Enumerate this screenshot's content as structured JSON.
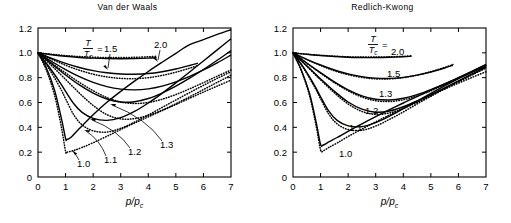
{
  "figure": {
    "xlabel": "p/p_c",
    "ylabel": "",
    "legend_prefix": "T",
    "legend_denominator": "Tc",
    "legend_equals": "="
  },
  "panels": [
    {
      "id": "van-der-waals",
      "title": "Van der Waals",
      "labels": [
        "1.5",
        "2.0",
        "1.0",
        "1.1",
        "1.2",
        "1.3"
      ]
    },
    {
      "id": "redlich-kwong",
      "title": "Redlich-Kwong",
      "labels": [
        "2.0",
        "1.5",
        "1.3",
        "1.2",
        "1.1",
        "1.0"
      ]
    }
  ],
  "axes": {
    "xticks": [
      "0",
      "1",
      "2",
      "3",
      "4",
      "5",
      "6",
      "7"
    ],
    "yticks": [
      "0",
      "0.2",
      "0.4",
      "0.6",
      "0.8",
      "1.0",
      "1.2"
    ]
  },
  "chart_data": {
    "type": "line",
    "xlabel": "p/p_c",
    "ylabel": "Z",
    "xlim": [
      0,
      7
    ],
    "ylim": [
      0,
      1.2
    ],
    "grid": false,
    "legend": "T/Tc =",
    "legend_position": "inside-top",
    "series_styles": {
      "solid": "equation of state prediction",
      "dotted": "experimental data"
    },
    "panels": [
      {
        "name": "Van der Waals",
        "series": [
          {
            "name": "T/Tc = 2.0 (model)",
            "style": "solid",
            "x": [
              0,
              0.5,
              1,
              1.5,
              2,
              2.5,
              3,
              3.5,
              4,
              4.3
            ],
            "y": [
              1.0,
              0.985,
              0.972,
              0.963,
              0.957,
              0.953,
              0.952,
              0.953,
              0.957,
              0.961
            ]
          },
          {
            "name": "T/Tc = 2.0 (data)",
            "style": "dotted",
            "x": [
              0,
              0.5,
              1,
              1.5,
              2,
              2.5,
              3,
              3.5,
              4,
              4.3
            ],
            "y": [
              1.0,
              0.988,
              0.978,
              0.97,
              0.965,
              0.962,
              0.962,
              0.964,
              0.968,
              0.972
            ]
          },
          {
            "name": "T/Tc = 1.5 (model)",
            "style": "solid",
            "x": [
              0,
              0.5,
              1,
              1.5,
              2,
              2.5,
              3,
              3.5,
              4,
              4.5,
              5,
              5.5,
              5.8
            ],
            "y": [
              1.0,
              0.955,
              0.915,
              0.882,
              0.857,
              0.84,
              0.83,
              0.828,
              0.833,
              0.848,
              0.87,
              0.898,
              0.917
            ]
          },
          {
            "name": "T/Tc = 1.5 (data)",
            "style": "dotted",
            "x": [
              0,
              0.5,
              1,
              1.5,
              2,
              2.5,
              3,
              3.5,
              4,
              4.5,
              5,
              5.5,
              5.8
            ],
            "y": [
              1.0,
              0.948,
              0.9,
              0.86,
              0.828,
              0.806,
              0.794,
              0.792,
              0.8,
              0.818,
              0.844,
              0.876,
              0.898
            ]
          },
          {
            "name": "T/Tc = 1.3 (model)",
            "style": "solid",
            "x": [
              0,
              0.5,
              1,
              1.5,
              2,
              2.5,
              3,
              3.5,
              4,
              4.5,
              5,
              5.5,
              6,
              6.5,
              7
            ],
            "y": [
              1.0,
              0.93,
              0.865,
              0.808,
              0.762,
              0.728,
              0.708,
              0.702,
              0.71,
              0.732,
              0.766,
              0.81,
              0.862,
              0.92,
              0.982
            ]
          },
          {
            "name": "T/Tc = 1.3 (data)",
            "style": "dotted",
            "x": [
              0,
              0.5,
              1,
              1.5,
              2,
              2.5,
              3,
              3.5,
              4,
              4.5,
              5,
              5.5,
              6,
              6.5,
              7
            ],
            "y": [
              1.0,
              0.918,
              0.838,
              0.762,
              0.695,
              0.64,
              0.604,
              0.592,
              0.6,
              0.626,
              0.664,
              0.71,
              0.76,
              0.812,
              0.862
            ]
          },
          {
            "name": "T/Tc = 1.2 (model)",
            "style": "solid",
            "x": [
              0,
              0.5,
              1,
              1.5,
              2,
              2.5,
              3,
              3.5,
              4,
              4.5,
              5,
              5.5,
              6,
              6.5,
              7
            ],
            "y": [
              1.0,
              0.91,
              0.822,
              0.742,
              0.676,
              0.628,
              0.604,
              0.606,
              0.632,
              0.676,
              0.732,
              0.796,
              0.866,
              0.94,
              1.018
            ]
          },
          {
            "name": "T/Tc = 1.2 (data)",
            "style": "dotted",
            "x": [
              0,
              0.5,
              1,
              1.5,
              2,
              2.5,
              3,
              3.5,
              4,
              4.5,
              5,
              5.5,
              6,
              6.5,
              7
            ],
            "y": [
              1.0,
              0.896,
              0.786,
              0.676,
              0.576,
              0.502,
              0.468,
              0.47,
              0.496,
              0.538,
              0.59,
              0.646,
              0.704,
              0.762,
              0.82
            ]
          },
          {
            "name": "T/Tc = 1.1 (model)",
            "style": "solid",
            "x": [
              0,
              0.4,
              0.8,
              1.0,
              1.3,
              1.6,
              2,
              2.5,
              3,
              3.5,
              4,
              4.5,
              5,
              5.5,
              6,
              6.5,
              7
            ],
            "y": [
              1.0,
              0.888,
              0.76,
              0.69,
              0.59,
              0.52,
              0.472,
              0.456,
              0.478,
              0.528,
              0.596,
              0.674,
              0.758,
              0.846,
              0.934,
              1.024,
              1.114
            ]
          },
          {
            "name": "T/Tc = 1.1 (data)",
            "style": "dotted",
            "x": [
              0,
              0.4,
              0.8,
              1.0,
              1.3,
              1.6,
              2,
              2.5,
              3,
              3.5,
              4,
              4.5,
              5,
              5.5,
              6,
              6.5,
              7
            ],
            "y": [
              1.0,
              0.872,
              0.72,
              0.63,
              0.5,
              0.42,
              0.372,
              0.362,
              0.392,
              0.442,
              0.5,
              0.56,
              0.62,
              0.68,
              0.738,
              0.794,
              0.848
            ]
          },
          {
            "name": "T/Tc = 1.0 (model)",
            "style": "solid",
            "x": [
              0,
              0.3,
              0.6,
              0.85,
              1.0,
              1.05,
              1.2,
              1.5,
              2,
              2.5,
              3,
              3.5,
              4,
              4.5,
              5,
              5.5,
              6,
              6.5,
              7
            ],
            "y": [
              1.0,
              0.88,
              0.7,
              0.47,
              0.31,
              0.302,
              0.32,
              0.39,
              0.502,
              0.602,
              0.69,
              0.772,
              0.85,
              0.924,
              0.996,
              1.066,
              1.106,
              1.148,
              1.186
            ]
          },
          {
            "name": "T/Tc = 1.0 (data)",
            "style": "dotted",
            "x": [
              0,
              0.3,
              0.6,
              0.85,
              1.0,
              1.05,
              1.3,
              1.6,
              2,
              2.5,
              3,
              3.5,
              4,
              4.5,
              5,
              5.5,
              6,
              6.5,
              7
            ],
            "y": [
              1.0,
              0.862,
              0.66,
              0.4,
              0.206,
              0.2,
              0.214,
              0.238,
              0.276,
              0.328,
              0.382,
              0.434,
              0.484,
              0.534,
              0.584,
              0.634,
              0.684,
              0.732,
              0.78
            ]
          }
        ]
      },
      {
        "name": "Redlich-Kwong",
        "series": [
          {
            "name": "T/Tc = 2.0 (model)",
            "style": "solid",
            "x": [
              0,
              0.5,
              1,
              1.5,
              2,
              2.5,
              3,
              3.5,
              4,
              4.3
            ],
            "y": [
              1.0,
              0.988,
              0.978,
              0.97,
              0.965,
              0.962,
              0.962,
              0.964,
              0.968,
              0.972
            ]
          },
          {
            "name": "T/Tc = 2.0 (data)",
            "style": "dotted",
            "x": [
              0,
              0.5,
              1,
              1.5,
              2,
              2.5,
              3,
              3.5,
              4,
              4.3
            ],
            "y": [
              1.0,
              0.989,
              0.98,
              0.973,
              0.968,
              0.966,
              0.966,
              0.968,
              0.972,
              0.976
            ]
          },
          {
            "name": "T/Tc = 1.5 (model)",
            "style": "solid",
            "x": [
              0,
              0.5,
              1,
              1.5,
              2,
              2.5,
              3,
              3.5,
              4,
              4.5,
              5,
              5.5,
              5.8
            ],
            "y": [
              1.0,
              0.948,
              0.902,
              0.862,
              0.83,
              0.808,
              0.796,
              0.794,
              0.802,
              0.82,
              0.846,
              0.878,
              0.9
            ]
          },
          {
            "name": "T/Tc = 1.5 (data)",
            "style": "dotted",
            "x": [
              0,
              0.5,
              1,
              1.5,
              2,
              2.5,
              3,
              3.5,
              4,
              4.5,
              5,
              5.5,
              5.8
            ],
            "y": [
              1.0,
              0.946,
              0.898,
              0.856,
              0.824,
              0.802,
              0.79,
              0.79,
              0.8,
              0.82,
              0.848,
              0.882,
              0.906
            ]
          },
          {
            "name": "T/Tc = 1.3 (model)",
            "style": "solid",
            "x": [
              0,
              0.5,
              1,
              1.5,
              2,
              2.5,
              3,
              3.5,
              4,
              4.5,
              5,
              5.5,
              6,
              6.5,
              7
            ],
            "y": [
              1.0,
              0.918,
              0.84,
              0.766,
              0.702,
              0.654,
              0.626,
              0.62,
              0.634,
              0.664,
              0.704,
              0.75,
              0.8,
              0.852,
              0.906
            ]
          },
          {
            "name": "T/Tc = 1.3 (data)",
            "style": "dotted",
            "x": [
              0,
              0.5,
              1,
              1.5,
              2,
              2.5,
              3,
              3.5,
              4,
              4.5,
              5,
              5.5,
              6,
              6.5,
              7
            ],
            "y": [
              1.0,
              0.916,
              0.836,
              0.76,
              0.694,
              0.644,
              0.614,
              0.608,
              0.622,
              0.652,
              0.694,
              0.742,
              0.794,
              0.846,
              0.9
            ]
          },
          {
            "name": "T/Tc = 1.2 (model)",
            "style": "solid",
            "x": [
              0,
              0.5,
              1,
              1.5,
              2,
              2.5,
              3,
              3.5,
              4,
              4.5,
              5,
              5.5,
              6,
              6.5,
              7
            ],
            "y": [
              1.0,
              0.896,
              0.79,
              0.69,
              0.604,
              0.546,
              0.522,
              0.532,
              0.566,
              0.612,
              0.664,
              0.718,
              0.774,
              0.83,
              0.886
            ]
          },
          {
            "name": "T/Tc = 1.2 (data)",
            "style": "dotted",
            "x": [
              0,
              0.5,
              1,
              1.5,
              2,
              2.5,
              3,
              3.5,
              4,
              4.5,
              5,
              5.5,
              6,
              6.5,
              7
            ],
            "y": [
              1.0,
              0.892,
              0.782,
              0.678,
              0.588,
              0.528,
              0.504,
              0.516,
              0.552,
              0.6,
              0.654,
              0.71,
              0.766,
              0.822,
              0.878
            ]
          },
          {
            "name": "T/Tc = 1.1 (model)",
            "style": "solid",
            "x": [
              0,
              0.4,
              0.8,
              1.0,
              1.3,
              1.6,
              2,
              2.5,
              3,
              3.5,
              4,
              4.5,
              5,
              5.5,
              6,
              6.5,
              7
            ],
            "y": [
              1.0,
              0.876,
              0.73,
              0.646,
              0.53,
              0.456,
              0.412,
              0.406,
              0.438,
              0.49,
              0.55,
              0.612,
              0.674,
              0.734,
              0.792,
              0.848,
              0.902
            ]
          },
          {
            "name": "T/Tc = 1.1 (data)",
            "style": "dotted",
            "x": [
              0,
              0.4,
              0.8,
              1.0,
              1.3,
              1.6,
              2,
              2.5,
              3,
              3.5,
              4,
              4.5,
              5,
              5.5,
              6,
              6.5,
              7
            ],
            "y": [
              1.0,
              0.87,
              0.718,
              0.63,
              0.506,
              0.428,
              0.382,
              0.376,
              0.41,
              0.464,
              0.524,
              0.588,
              0.65,
              0.712,
              0.77,
              0.826,
              0.88
            ]
          },
          {
            "name": "T/Tc = 1.0 (model)",
            "style": "solid",
            "x": [
              0,
              0.3,
              0.6,
              0.85,
              1.0,
              1.1,
              1.3,
              1.6,
              2,
              2.5,
              3,
              3.5,
              4,
              4.5,
              5,
              5.5,
              6,
              6.5,
              7
            ],
            "y": [
              1.0,
              0.862,
              0.672,
              0.43,
              0.262,
              0.258,
              0.282,
              0.318,
              0.368,
              0.428,
              0.486,
              0.542,
              0.596,
              0.648,
              0.7,
              0.75,
              0.798,
              0.844,
              0.89
            ]
          },
          {
            "name": "T/Tc = 1.0 (data)",
            "style": "dotted",
            "x": [
              0,
              0.3,
              0.6,
              0.85,
              1.0,
              1.1,
              1.3,
              1.6,
              2,
              2.5,
              3,
              3.5,
              4,
              4.5,
              5,
              5.5,
              6,
              6.5,
              7
            ],
            "y": [
              1.0,
              0.856,
              0.656,
              0.4,
              0.218,
              0.212,
              0.238,
              0.274,
              0.326,
              0.386,
              0.444,
              0.5,
              0.554,
              0.606,
              0.658,
              0.708,
              0.756,
              0.802,
              0.848
            ]
          }
        ]
      }
    ]
  }
}
